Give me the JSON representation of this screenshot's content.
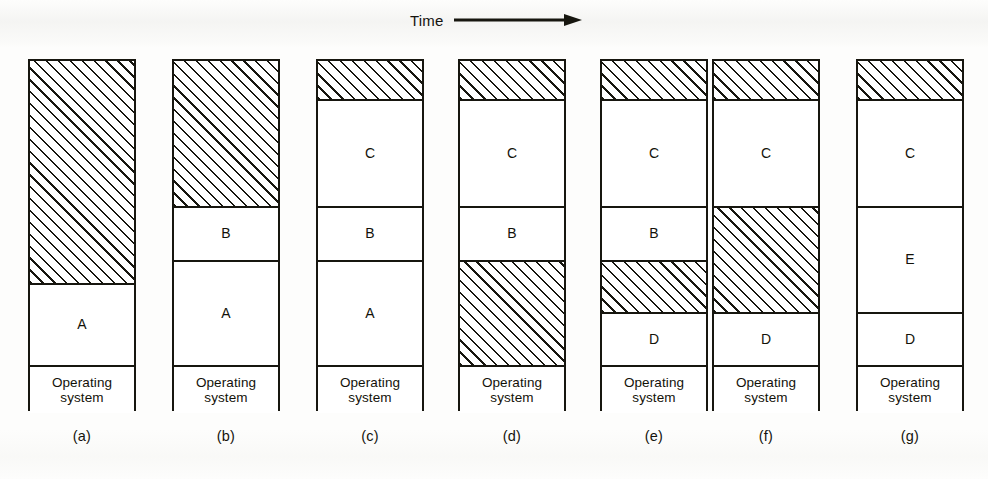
{
  "figure": {
    "time_axis_label": "Time",
    "time_axis_icon": "right-arrow-icon",
    "background_color": "#fdfdfc",
    "ink_color": "#17160f",
    "free_memory_pattern": "diagonal-hatch",
    "os_label_line1": "Operating",
    "os_label_line2": "system"
  },
  "columns": [
    {
      "caption": "(a)",
      "segments": [
        {
          "label": "",
          "kind": "free",
          "top": 0,
          "height": 222
        },
        {
          "label": "A",
          "kind": "process",
          "top": 222,
          "height": 82
        },
        {
          "label": "Operating system",
          "kind": "os",
          "top": 304,
          "height": 48
        }
      ]
    },
    {
      "caption": "(b)",
      "segments": [
        {
          "label": "",
          "kind": "free",
          "top": 0,
          "height": 145
        },
        {
          "label": "B",
          "kind": "process",
          "top": 145,
          "height": 54
        },
        {
          "label": "A",
          "kind": "process",
          "top": 199,
          "height": 105
        },
        {
          "label": "Operating system",
          "kind": "os",
          "top": 304,
          "height": 48
        }
      ]
    },
    {
      "caption": "(c)",
      "segments": [
        {
          "label": "",
          "kind": "free",
          "top": 0,
          "height": 38
        },
        {
          "label": "C",
          "kind": "process",
          "top": 38,
          "height": 107
        },
        {
          "label": "B",
          "kind": "process",
          "top": 145,
          "height": 54
        },
        {
          "label": "A",
          "kind": "process",
          "top": 199,
          "height": 105
        },
        {
          "label": "Operating system",
          "kind": "os",
          "top": 304,
          "height": 48
        }
      ]
    },
    {
      "caption": "(d)",
      "segments": [
        {
          "label": "",
          "kind": "free",
          "top": 0,
          "height": 38
        },
        {
          "label": "C",
          "kind": "process",
          "top": 38,
          "height": 107
        },
        {
          "label": "B",
          "kind": "process",
          "top": 145,
          "height": 54
        },
        {
          "label": "",
          "kind": "free",
          "top": 199,
          "height": 105
        },
        {
          "label": "Operating system",
          "kind": "os",
          "top": 304,
          "height": 48
        }
      ]
    },
    {
      "caption": "(e)",
      "segments": [
        {
          "label": "",
          "kind": "free",
          "top": 0,
          "height": 38
        },
        {
          "label": "C",
          "kind": "process",
          "top": 38,
          "height": 107
        },
        {
          "label": "B",
          "kind": "process",
          "top": 145,
          "height": 54
        },
        {
          "label": "",
          "kind": "free",
          "top": 199,
          "height": 52
        },
        {
          "label": "D",
          "kind": "process",
          "top": 251,
          "height": 53
        },
        {
          "label": "Operating system",
          "kind": "os",
          "top": 304,
          "height": 48
        }
      ]
    },
    {
      "caption": "(f)",
      "segments": [
        {
          "label": "",
          "kind": "free",
          "top": 0,
          "height": 38
        },
        {
          "label": "C",
          "kind": "process",
          "top": 38,
          "height": 107
        },
        {
          "label": "",
          "kind": "free",
          "top": 145,
          "height": 106
        },
        {
          "label": "D",
          "kind": "process",
          "top": 251,
          "height": 53
        },
        {
          "label": "Operating system",
          "kind": "os",
          "top": 304,
          "height": 48
        }
      ]
    },
    {
      "caption": "(g)",
      "segments": [
        {
          "label": "",
          "kind": "free",
          "top": 0,
          "height": 38
        },
        {
          "label": "C",
          "kind": "process",
          "top": 38,
          "height": 107
        },
        {
          "label": "E",
          "kind": "process",
          "top": 145,
          "height": 106
        },
        {
          "label": "D",
          "kind": "process",
          "top": 251,
          "height": 53
        },
        {
          "label": "Operating system",
          "kind": "os",
          "top": 304,
          "height": 48
        }
      ]
    }
  ]
}
